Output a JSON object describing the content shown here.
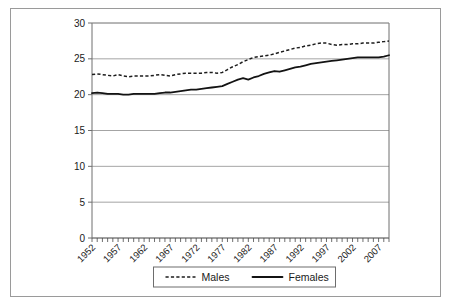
{
  "chart_data": {
    "type": "line",
    "title": "",
    "subtitle": "",
    "xlabel": "",
    "ylabel": "",
    "xlim": [
      1952,
      2009
    ],
    "ylim": [
      0,
      30
    ],
    "yticks": [
      0,
      5,
      10,
      15,
      20,
      25,
      30
    ],
    "ytick_labels": [
      "0",
      "5",
      "10",
      "15",
      "20",
      "25",
      "30"
    ],
    "x": [
      1952,
      1953,
      1954,
      1955,
      1956,
      1957,
      1958,
      1959,
      1960,
      1961,
      1962,
      1963,
      1964,
      1965,
      1966,
      1967,
      1968,
      1969,
      1970,
      1971,
      1972,
      1973,
      1974,
      1975,
      1976,
      1977,
      1978,
      1979,
      1980,
      1981,
      1982,
      1983,
      1984,
      1985,
      1986,
      1987,
      1988,
      1989,
      1990,
      1991,
      1992,
      1993,
      1994,
      1995,
      1996,
      1997,
      1998,
      1999,
      2000,
      2001,
      2002,
      2003,
      2004,
      2005,
      2006,
      2007,
      2008,
      2009
    ],
    "xtick_labels": [
      "1952",
      "1957",
      "1962",
      "1967",
      "1972",
      "1977",
      "1982",
      "1987",
      "1992",
      "1997",
      "2002",
      "2007"
    ],
    "xtick_values": [
      1952,
      1957,
      1962,
      1967,
      1972,
      1977,
      1982,
      1987,
      1992,
      1997,
      2002,
      2007
    ],
    "minor_xticks_every": 1,
    "grid": "horizontal",
    "legend_position": "bottom-center",
    "series": [
      {
        "name": "Males",
        "style": "dashed",
        "color": "#1d1d1d",
        "values": [
          22.8,
          22.9,
          22.8,
          22.7,
          22.6,
          22.8,
          22.6,
          22.5,
          22.6,
          22.6,
          22.6,
          22.6,
          22.7,
          22.8,
          22.7,
          22.6,
          22.8,
          22.9,
          23.0,
          23.0,
          23.0,
          23.0,
          23.1,
          23.1,
          23.0,
          23.1,
          23.5,
          23.9,
          24.2,
          24.6,
          24.9,
          25.2,
          25.3,
          25.4,
          25.5,
          25.7,
          25.9,
          26.1,
          26.3,
          26.5,
          26.6,
          26.8,
          26.9,
          27.1,
          27.2,
          27.2,
          27.0,
          26.9,
          27.0,
          27.0,
          27.1,
          27.1,
          27.2,
          27.2,
          27.2,
          27.3,
          27.4,
          27.5
        ]
      },
      {
        "name": "Females",
        "style": "solid",
        "color": "#131313",
        "values": [
          20.2,
          20.3,
          20.2,
          20.1,
          20.1,
          20.1,
          20.0,
          20.0,
          20.1,
          20.1,
          20.1,
          20.1,
          20.1,
          20.2,
          20.3,
          20.3,
          20.4,
          20.5,
          20.6,
          20.7,
          20.7,
          20.8,
          20.9,
          21.0,
          21.1,
          21.2,
          21.5,
          21.8,
          22.1,
          22.3,
          22.1,
          22.4,
          22.6,
          22.9,
          23.1,
          23.3,
          23.2,
          23.4,
          23.6,
          23.8,
          23.9,
          24.1,
          24.3,
          24.4,
          24.5,
          24.6,
          24.7,
          24.8,
          24.9,
          25.0,
          25.1,
          25.2,
          25.2,
          25.2,
          25.2,
          25.2,
          25.3,
          25.5
        ]
      }
    ]
  },
  "legend": {
    "items": [
      {
        "label": "Males"
      },
      {
        "label": "Females"
      }
    ]
  }
}
